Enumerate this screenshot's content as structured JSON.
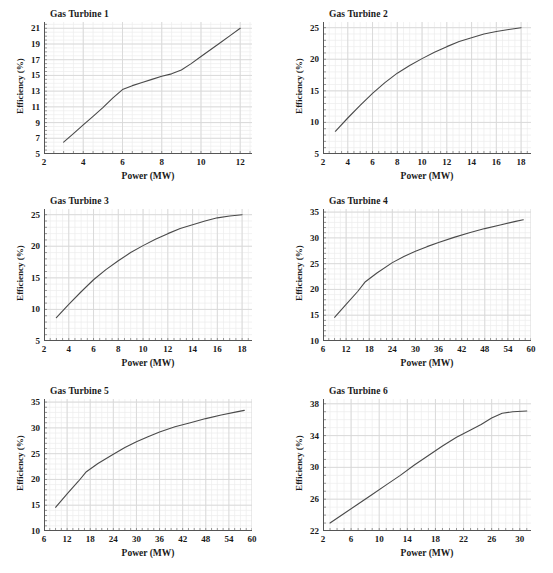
{
  "figure": {
    "axis_label_x": "Power (MW)",
    "axis_label_y": "Efficiency (%)",
    "line_color": "#4a4a4a",
    "grid_color": "#d8d8d8",
    "grid_minor_color": "#ececec",
    "axis_color": "#555555",
    "background": "#ffffff"
  },
  "chart_data": [
    {
      "type": "line",
      "title": "Gas Turbine 1",
      "xlabel": "Power (MW)",
      "ylabel": "Efficiency (%)",
      "xlim": [
        2,
        12.6
      ],
      "ylim": [
        5,
        21.8
      ],
      "xticks": [
        2,
        4,
        6,
        8,
        10,
        12
      ],
      "yticks": [
        5,
        7,
        9,
        11,
        13,
        15,
        17,
        19,
        21
      ],
      "xminor_step": 0.5,
      "yminor_step": 0.5,
      "grid": true,
      "legend": "none",
      "x": [
        3.0,
        3.5,
        4.0,
        4.5,
        5.0,
        5.5,
        6.0,
        6.5,
        7.0,
        7.5,
        8.0,
        8.5,
        9.0,
        9.5,
        10.0,
        10.5,
        11.0,
        11.5,
        12.0
      ],
      "y": [
        6.5,
        7.6,
        8.7,
        9.8,
        10.9,
        12.1,
        13.2,
        13.7,
        14.1,
        14.5,
        14.9,
        15.2,
        15.7,
        16.5,
        17.4,
        18.3,
        19.2,
        20.1,
        21.0
      ]
    },
    {
      "type": "line",
      "title": "Gas Turbine 2",
      "xlabel": "Power (MW)",
      "ylabel": "Efficiency (%)",
      "xlim": [
        2,
        18.8
      ],
      "ylim": [
        5,
        25.9
      ],
      "xticks": [
        2,
        4,
        6,
        8,
        10,
        12,
        14,
        16,
        18
      ],
      "yticks": [
        5,
        10,
        15,
        20,
        25
      ],
      "xminor_step": 0.5,
      "yminor_step": 1,
      "grid": true,
      "legend": "none",
      "x": [
        3.0,
        4.0,
        5.0,
        6.0,
        7.0,
        8.0,
        9.0,
        10.0,
        11.0,
        12.0,
        13.0,
        14.0,
        15.0,
        16.0,
        17.0,
        18.0
      ],
      "y": [
        8.6,
        10.7,
        12.7,
        14.6,
        16.3,
        17.8,
        19.0,
        20.1,
        21.1,
        22.0,
        22.8,
        23.4,
        24.0,
        24.4,
        24.7,
        25.0
      ]
    },
    {
      "type": "line",
      "title": "Gas Turbine 3",
      "xlabel": "Power (MW)",
      "ylabel": "Efficiency (%)",
      "xlim": [
        2,
        18.8
      ],
      "ylim": [
        5,
        25.9
      ],
      "xticks": [
        2,
        4,
        6,
        8,
        10,
        12,
        14,
        16,
        18
      ],
      "yticks": [
        5,
        10,
        15,
        20,
        25
      ],
      "xminor_step": 0.5,
      "yminor_step": 1,
      "grid": true,
      "legend": "none",
      "x": [
        3.0,
        4.0,
        5.0,
        6.0,
        7.0,
        8.0,
        9.0,
        10.0,
        11.0,
        12.0,
        13.0,
        14.0,
        15.0,
        16.0,
        17.0,
        18.0
      ],
      "y": [
        8.7,
        10.8,
        12.8,
        14.7,
        16.3,
        17.7,
        19.0,
        20.1,
        21.1,
        22.0,
        22.8,
        23.4,
        24.0,
        24.5,
        24.8,
        25.0
      ]
    },
    {
      "type": "line",
      "title": "Gas Turbine 4",
      "xlabel": "Power (MW)",
      "ylabel": "Efficiency (%)",
      "xlim": [
        6,
        60
      ],
      "ylim": [
        10,
        35.6
      ],
      "xticks": [
        6,
        12,
        18,
        24,
        30,
        36,
        42,
        48,
        54,
        60
      ],
      "yticks": [
        10,
        15,
        20,
        25,
        30,
        35
      ],
      "xminor_step": 1.5,
      "yminor_step": 1,
      "grid": true,
      "legend": "none",
      "x": [
        9.0,
        12.0,
        15.0,
        17.0,
        20.0,
        24.0,
        27.0,
        30.0,
        33.0,
        36.0,
        40.0,
        44.0,
        48.0,
        52.0,
        56.0,
        58.0
      ],
      "y": [
        14.6,
        17.1,
        19.6,
        21.5,
        23.2,
        25.2,
        26.4,
        27.4,
        28.3,
        29.1,
        30.1,
        31.0,
        31.8,
        32.5,
        33.2,
        33.5
      ]
    },
    {
      "type": "line",
      "title": "Gas Turbine 5",
      "xlabel": "Power (MW)",
      "ylabel": "Efficiency (%)",
      "xlim": [
        6,
        60
      ],
      "ylim": [
        10,
        35.6
      ],
      "xticks": [
        6,
        12,
        18,
        24,
        30,
        36,
        42,
        48,
        54,
        60
      ],
      "yticks": [
        10,
        15,
        20,
        25,
        30,
        35
      ],
      "xminor_step": 1.5,
      "yminor_step": 1,
      "grid": true,
      "legend": "none",
      "x": [
        9.0,
        12.0,
        15.0,
        17.0,
        20.0,
        24.0,
        27.0,
        30.0,
        33.0,
        36.0,
        40.0,
        44.0,
        48.0,
        52.0,
        56.0,
        58.0
      ],
      "y": [
        14.6,
        17.2,
        19.7,
        21.5,
        23.1,
        24.9,
        26.2,
        27.3,
        28.3,
        29.2,
        30.2,
        31.0,
        31.8,
        32.5,
        33.1,
        33.4
      ]
    },
    {
      "type": "line",
      "title": "Gas Turbine 6",
      "xlabel": "Power (MW)",
      "ylabel": "Efficiency (%)",
      "xlim": [
        2,
        31.6
      ],
      "ylim": [
        22,
        38.6
      ],
      "xticks": [
        2,
        6,
        10,
        14,
        18,
        22,
        26,
        30
      ],
      "yticks": [
        22,
        26,
        30,
        34,
        38
      ],
      "xminor_step": 1,
      "yminor_step": 1,
      "grid": true,
      "legend": "none",
      "x": [
        3.0,
        5.0,
        7.0,
        9.0,
        11.0,
        13.0,
        15.0,
        17.0,
        19.0,
        21.0,
        23.0,
        24.5,
        26.0,
        27.5,
        29.0,
        31.0
      ],
      "y": [
        23.0,
        24.2,
        25.4,
        26.6,
        27.8,
        29.0,
        30.3,
        31.5,
        32.7,
        33.8,
        34.7,
        35.4,
        36.2,
        36.8,
        37.0,
        37.1
      ]
    }
  ]
}
